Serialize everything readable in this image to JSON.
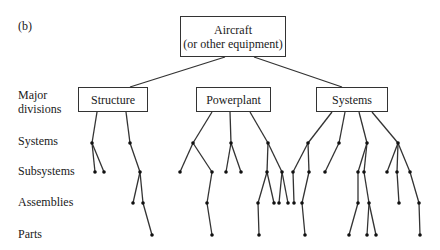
{
  "figure_label": "(b)",
  "root": {
    "line1": "Aircraft",
    "line2": "(or other equipment)"
  },
  "levels": {
    "major_line1": "Major",
    "major_line2": "divisions",
    "systems": "Systems",
    "subsystems": "Subsystems",
    "assemblies": "Assemblies",
    "parts": "Parts"
  },
  "divisions": [
    {
      "label": "Structure"
    },
    {
      "label": "Powerplant"
    },
    {
      "label": "Systems"
    }
  ],
  "tree": {
    "edges": [
      [
        225,
        57,
        130,
        87
      ],
      [
        254,
        57,
        342,
        87
      ],
      [
        97,
        112,
        92,
        143
      ],
      [
        126,
        112,
        130,
        143
      ],
      [
        92,
        143,
        95,
        172
      ],
      [
        92,
        143,
        104,
        172
      ],
      [
        130,
        143,
        140,
        172
      ],
      [
        140,
        172,
        133,
        203
      ],
      [
        140,
        172,
        143,
        203
      ],
      [
        143,
        203,
        152,
        235
      ],
      [
        212,
        112,
        193,
        143
      ],
      [
        230,
        112,
        231,
        143
      ],
      [
        250,
        112,
        268,
        143
      ],
      [
        193,
        143,
        180,
        172
      ],
      [
        193,
        143,
        212,
        172
      ],
      [
        212,
        172,
        207,
        203
      ],
      [
        207,
        203,
        212,
        235
      ],
      [
        231,
        143,
        226,
        172
      ],
      [
        231,
        143,
        241,
        172
      ],
      [
        268,
        143,
        267,
        172
      ],
      [
        268,
        143,
        282,
        172
      ],
      [
        267,
        172,
        258,
        203
      ],
      [
        267,
        172,
        274,
        203
      ],
      [
        258,
        203,
        259,
        235
      ],
      [
        282,
        172,
        279,
        203
      ],
      [
        282,
        172,
        288,
        203
      ],
      [
        332,
        112,
        308,
        143
      ],
      [
        345,
        112,
        339,
        143
      ],
      [
        359,
        112,
        367,
        143
      ],
      [
        372,
        112,
        398,
        143
      ],
      [
        308,
        143,
        293,
        172
      ],
      [
        308,
        143,
        309,
        172
      ],
      [
        293,
        172,
        294,
        203
      ],
      [
        309,
        172,
        302,
        203
      ],
      [
        302,
        203,
        305,
        235
      ],
      [
        339,
        143,
        325,
        172
      ],
      [
        367,
        143,
        358,
        172
      ],
      [
        367,
        143,
        364,
        172
      ],
      [
        358,
        172,
        358,
        203
      ],
      [
        358,
        203,
        349,
        235
      ],
      [
        364,
        172,
        369,
        203
      ],
      [
        369,
        203,
        367,
        235
      ],
      [
        369,
        203,
        376,
        235
      ],
      [
        398,
        143,
        387,
        172
      ],
      [
        398,
        143,
        397,
        172
      ],
      [
        398,
        143,
        410,
        172
      ],
      [
        397,
        172,
        399,
        203
      ],
      [
        410,
        172,
        419,
        203
      ],
      [
        419,
        203,
        420,
        235
      ]
    ],
    "nodes": [
      [
        92,
        143
      ],
      [
        130,
        143
      ],
      [
        95,
        172
      ],
      [
        104,
        172
      ],
      [
        140,
        172
      ],
      [
        133,
        203
      ],
      [
        143,
        203
      ],
      [
        152,
        235
      ],
      [
        193,
        143
      ],
      [
        231,
        143
      ],
      [
        268,
        143
      ],
      [
        180,
        172
      ],
      [
        212,
        172
      ],
      [
        207,
        203
      ],
      [
        212,
        235
      ],
      [
        226,
        172
      ],
      [
        241,
        172
      ],
      [
        267,
        172
      ],
      [
        282,
        172
      ],
      [
        258,
        203
      ],
      [
        274,
        203
      ],
      [
        259,
        235
      ],
      [
        279,
        203
      ],
      [
        288,
        203
      ],
      [
        308,
        143
      ],
      [
        339,
        143
      ],
      [
        367,
        143
      ],
      [
        398,
        143
      ],
      [
        293,
        172
      ],
      [
        309,
        172
      ],
      [
        294,
        203
      ],
      [
        302,
        203
      ],
      [
        305,
        235
      ],
      [
        325,
        172
      ],
      [
        358,
        172
      ],
      [
        364,
        172
      ],
      [
        358,
        203
      ],
      [
        349,
        235
      ],
      [
        369,
        203
      ],
      [
        367,
        235
      ],
      [
        376,
        235
      ],
      [
        387,
        172
      ],
      [
        397,
        172
      ],
      [
        410,
        172
      ],
      [
        399,
        203
      ],
      [
        419,
        203
      ],
      [
        420,
        235
      ]
    ]
  },
  "colors": {
    "line": "#333333",
    "text": "#1a1a1a"
  }
}
